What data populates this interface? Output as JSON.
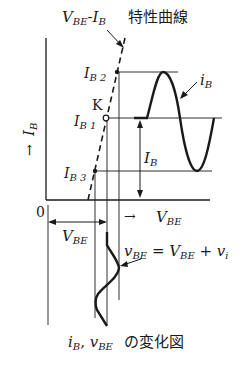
{
  "title": {
    "curve_label_main": "V",
    "curve_label_sub1": "BE",
    "curve_label_dash": "-",
    "curve_label_main2": "I",
    "curve_label_sub2": "B",
    "curve_label_jp": "特性曲線"
  },
  "axes": {
    "y_arrow": "→",
    "y_main": "I",
    "y_sub": "B",
    "origin": "0",
    "x_arrow": "→",
    "x_main": "V",
    "x_sub": "BE"
  },
  "points": {
    "ib2_main": "I",
    "ib2_sub": "B 2",
    "k": "K",
    "ib1_main": "I",
    "ib1_sub": "B 1",
    "ib3_main": "I",
    "ib3_sub": "B 3"
  },
  "labels": {
    "ib_wave_main": "i",
    "ib_wave_sub": "B",
    "ib_amp_main": "I",
    "ib_amp_sub": "B",
    "vbe_dim_main": "V",
    "vbe_dim_sub": "BE",
    "vbe_eq_v": "v",
    "vbe_eq_vsub": "BE",
    "vbe_eq_eq": " = ",
    "vbe_eq_V": "V",
    "vbe_eq_Vsub": "BE",
    "vbe_eq_plus": " + ",
    "vbe_eq_vi": "v",
    "vbe_eq_visub": "i"
  },
  "caption": {
    "a_main": "i",
    "a_sub": "B",
    "comma": ", ",
    "b_main": "v",
    "b_sub": "BE",
    "jp": " の変化図"
  }
}
